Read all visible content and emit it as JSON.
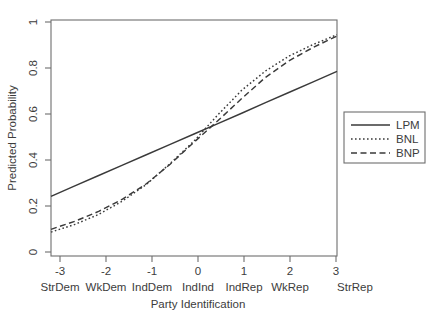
{
  "chart_data": {
    "type": "line",
    "title": "",
    "xlabel": "Party Identification",
    "ylabel": "Predicted Probability",
    "xlim": [
      -3,
      3
    ],
    "ylim": [
      0,
      1
    ],
    "grid": false,
    "legend_position": "right-outside",
    "x_tick_values": [
      "-3",
      "-2",
      "-1",
      "0",
      "1",
      "2",
      "3"
    ],
    "x_category_labels": [
      "StrDem",
      "WkDem",
      "IndDem",
      "IndInd",
      "IndRep",
      "WkRep",
      "StrRep"
    ],
    "y_tick_values": [
      "0",
      "0.2",
      "0.4",
      "0.6",
      "0.8",
      "1"
    ],
    "x": [
      -3,
      -2.5,
      -2,
      -1.5,
      -1,
      -0.5,
      0,
      0.5,
      1,
      1.5,
      2,
      2.5,
      3
    ],
    "series": [
      {
        "name": "LPM",
        "style": "solid",
        "values": [
          0.253,
          0.297,
          0.341,
          0.385,
          0.429,
          0.473,
          0.517,
          0.561,
          0.605,
          0.65,
          0.694,
          0.738,
          0.782
        ]
      },
      {
        "name": "BNL",
        "style": "dotted",
        "values": [
          0.101,
          0.134,
          0.176,
          0.233,
          0.303,
          0.392,
          0.487,
          0.598,
          0.702,
          0.784,
          0.848,
          0.896,
          0.938
        ]
      },
      {
        "name": "BNP",
        "style": "dashed",
        "values": [
          0.113,
          0.147,
          0.189,
          0.241,
          0.306,
          0.389,
          0.482,
          0.573,
          0.667,
          0.757,
          0.828,
          0.884,
          0.932
        ]
      }
    ],
    "legend": [
      {
        "label": "LPM",
        "style": "solid"
      },
      {
        "label": "BNL",
        "style": "dotted"
      },
      {
        "label": "BNP",
        "style": "dashed"
      }
    ]
  }
}
